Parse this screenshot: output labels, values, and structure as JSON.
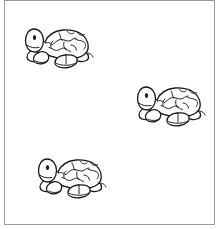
{
  "page": {
    "width": 219,
    "height": 229,
    "background_color": "#ffffff",
    "border_color": "#9a9a9a",
    "title": "",
    "description": "Three identical black-and-white cartoon turtle line drawings with globe-patterned shells arranged diagonally on a white framed page"
  },
  "frame": {
    "name": "page-border",
    "x": 4,
    "y": 0,
    "width": 211,
    "height": 225,
    "border_width": 1
  },
  "figures": [
    {
      "id": "turtle-1",
      "label": "Turtle",
      "x": 18,
      "y": 18,
      "width": 76,
      "height": 50,
      "ink_color": "#1a1a1a",
      "body_fill": "#ffffff"
    },
    {
      "id": "turtle-2",
      "label": "Turtle",
      "x": 130,
      "y": 76,
      "width": 76,
      "height": 50,
      "ink_color": "#1a1a1a",
      "body_fill": "#ffffff"
    },
    {
      "id": "turtle-3",
      "label": "Turtle",
      "x": 31,
      "y": 148,
      "width": 76,
      "height": 50,
      "ink_color": "#1a1a1a",
      "body_fill": "#ffffff"
    }
  ],
  "counts": {
    "turtle_count": 3
  }
}
